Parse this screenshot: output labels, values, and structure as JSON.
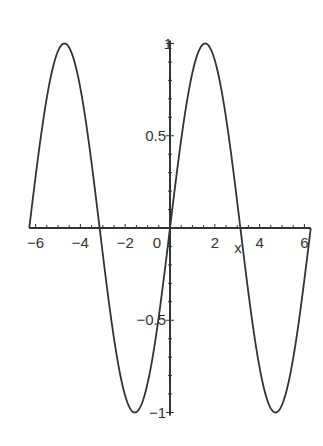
{
  "chart_data": {
    "type": "line",
    "title": "",
    "xlabel": "x",
    "ylabel": "",
    "function": "sin(x)",
    "xlim": [
      -6.283,
      6.283
    ],
    "ylim": [
      -1,
      1
    ],
    "grid": false,
    "legend": null,
    "x_ticks": [
      -6,
      -4,
      -2,
      0,
      2,
      4,
      6
    ],
    "x_tick_labels": [
      "-6",
      "-4",
      "-2",
      "0",
      "2",
      "4",
      "6"
    ],
    "y_ticks": [
      1,
      0.5,
      -0.5,
      -1
    ],
    "y_tick_labels": [
      "1",
      "0.5",
      "-0.5",
      "-1"
    ],
    "series": [
      {
        "name": "sin(x)",
        "x": [
          -6.283,
          -4.712,
          -3.142,
          -1.571,
          0,
          1.571,
          3.142,
          4.712,
          6.283
        ],
        "values": [
          0,
          1,
          0,
          -1,
          0,
          1,
          0,
          -1,
          0
        ]
      }
    ],
    "colors": {
      "axis": "#333333",
      "curve": "#333333"
    }
  }
}
